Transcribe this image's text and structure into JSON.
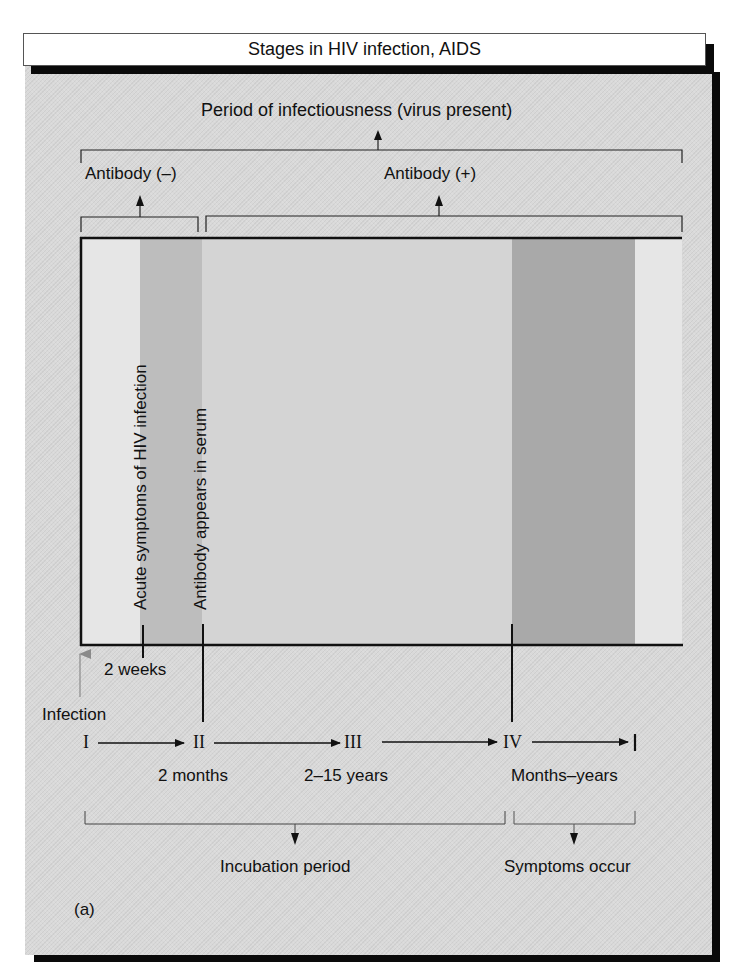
{
  "title": "Stages in HIV infection, AIDS",
  "top_brackets": {
    "period_of_infectiousness": "Period of infectiousness (virus present)",
    "antibody_negative": "Antibody (–)",
    "antibody_positive": "Antibody (+)"
  },
  "vertical_labels": {
    "acute_symptoms": "Acute symptoms of HIV infection",
    "antibody_appears": "Antibody appears in serum"
  },
  "timeline": {
    "two_weeks": "2 weeks",
    "infection": "Infection",
    "stages": [
      {
        "numeral": "I"
      },
      {
        "numeral": "II",
        "duration": "2 months"
      },
      {
        "numeral": "III",
        "duration": "2–15 years"
      },
      {
        "numeral": "IV",
        "duration": "Months–years"
      }
    ]
  },
  "bottom_brackets": {
    "incubation": "Incubation period",
    "symptoms": "Symptoms occur"
  },
  "panel_label": "(a)",
  "colors": {
    "panel_bg": "#d9d9d9",
    "chart_bg": "#e6e6e6",
    "band_light": "#d2d2d2",
    "band_acute": "#bdbdbd",
    "band_symptoms": "#a9a9a9",
    "infection_arrow": "#8a8a8a",
    "line": "#111111"
  }
}
